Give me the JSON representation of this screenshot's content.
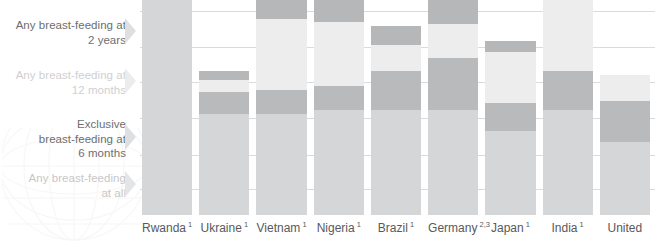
{
  "chart_data": {
    "type": "bar",
    "title": "",
    "subtitle": "",
    "xlabel": "",
    "ylabel": "",
    "stacked": true,
    "grid": true,
    "legend_position": "left-inline-labels",
    "ylim": [
      0,
      100
    ],
    "categories": [
      "Rwanda",
      "Ukraine",
      "Vietnam",
      "Nigeria",
      "Brazil",
      "Germany",
      "Japan",
      "India",
      "United"
    ],
    "category_footnotes": [
      "1",
      "1",
      "1",
      "1",
      "1",
      "2,3",
      "1",
      "1",
      ""
    ],
    "tick_labels": [
      "Rwanda 1",
      "Ukraine 1",
      "Vietnam 1",
      "Nigeria 1",
      "Brazil 1",
      "Germany 2,3",
      "Japan 1",
      "India 1",
      "United"
    ],
    "series": [
      {
        "name": "Any breast-feeding at all",
        "color": "#d5d6d7",
        "values": [
          100,
          47,
          47,
          49,
          49,
          49,
          39,
          49,
          34
        ]
      },
      {
        "name": "Exclusive breast-feeding at 6 months",
        "color": "#b9babc",
        "values": [
          34,
          10,
          11,
          11,
          18,
          24,
          13,
          18,
          19
        ]
      },
      {
        "name": "Any breast-feeding at 12 months",
        "color": "#ededee",
        "values": [
          54,
          6,
          33,
          30,
          12,
          16,
          24,
          51,
          12
        ]
      },
      {
        "name": "Any breast-feeding at 2 years",
        "color": "#b6b7b9",
        "values": [
          53,
          4,
          11,
          13,
          9,
          11,
          5,
          31,
          0
        ]
      }
    ],
    "gridline_values": [
      95,
      78,
      62,
      45,
      28,
      12
    ],
    "colors": {
      "segment_any_at_all": "#d5d6d7",
      "segment_exclusive_6mo": "#b9babc",
      "segment_any_12mo": "#ededee",
      "segment_any_2yr": "#b6b7b9",
      "gridline": "#d9dadb",
      "label_dark": "#6d6e70",
      "label_light": "#cfd0d1",
      "tick_text": "#58595b",
      "background": "#ffffff"
    }
  },
  "category_labels": [
    {
      "id": "any-2-years",
      "line1": "Any breast-feeding at",
      "line2": "2 years",
      "tone": "dark"
    },
    {
      "id": "any-12-months",
      "line1": "Any breast-feeding at",
      "line2": "12 months",
      "tone": "light"
    },
    {
      "id": "exclusive-6-months",
      "line1": "Exclusive",
      "line2": "breast-feeding at",
      "line3": "6 months",
      "tone": "dark"
    },
    {
      "id": "any-at-all",
      "line1": "Any breast-feeding",
      "line2": "at all",
      "tone": "mid"
    }
  ],
  "icons": {
    "pointer": "chevron-right-pointer-icon",
    "watermark": "globe-watermark-icon"
  }
}
